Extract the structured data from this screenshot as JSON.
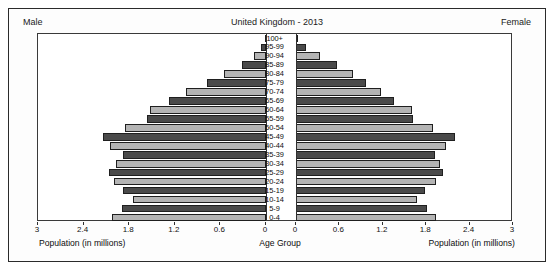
{
  "header": {
    "male_label": "Male",
    "female_label": "Female",
    "title": "United Kingdom - 2013"
  },
  "axes": {
    "left_axis_label": "Population (in millions)",
    "right_axis_label": "Population (in millions)",
    "center_axis_label": "Age Group",
    "left_ticks": [
      "3",
      "2.4",
      "1.8",
      "1.2",
      "0.6",
      "0"
    ],
    "right_ticks": [
      "0",
      "0.6",
      "1.2",
      "1.8",
      "2.4",
      "3"
    ]
  },
  "colors": {
    "dark_bar": "#4a4a4a",
    "light_bar": "#b4b4b4",
    "outline": "#1f1f1f",
    "frame": "#2b2b2b",
    "text": "#0d0d0d"
  },
  "chart_data": {
    "type": "bar",
    "title": "United Kingdom - 2013",
    "xlabel": "Population (in millions)",
    "ylabel": "Age Group",
    "xlim": [
      0,
      3
    ],
    "grid": false,
    "legend": [
      "Male",
      "Female"
    ],
    "legend_position": "top-corners",
    "orientation": "horizontal-pyramid",
    "categories": [
      "100+",
      "95-99",
      "90-94",
      "85-89",
      "80-84",
      "75-79",
      "70-74",
      "65-69",
      "60-64",
      "55-59",
      "50-54",
      "45-49",
      "40-44",
      "35-39",
      "30-34",
      "25-29",
      "20-24",
      "15-19",
      "10-14",
      "5-9",
      "0-4"
    ],
    "series": [
      {
        "name": "Male",
        "values": [
          0.01,
          0.06,
          0.16,
          0.32,
          0.55,
          0.78,
          1.05,
          1.27,
          1.52,
          1.57,
          1.85,
          2.15,
          2.05,
          1.88,
          1.98,
          2.06,
          2.0,
          1.88,
          1.75,
          1.9,
          2.02
        ]
      },
      {
        "name": "Female",
        "values": [
          0.03,
          0.14,
          0.33,
          0.56,
          0.79,
          0.97,
          1.18,
          1.36,
          1.6,
          1.62,
          1.9,
          2.2,
          2.08,
          1.92,
          1.99,
          2.03,
          1.94,
          1.79,
          1.67,
          1.81,
          1.93
        ]
      }
    ]
  }
}
